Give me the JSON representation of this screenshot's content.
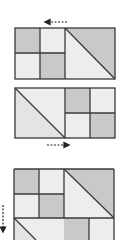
{
  "diagram": {
    "type": "tile-pattern-transformation",
    "colors": {
      "background": "#ffffff",
      "dark_fill": "#c9c9c9",
      "light_fill": "#ededed",
      "stroke": "#3a3a3a",
      "arrow": "#222222"
    },
    "panels": [
      {
        "id": "panel-1",
        "description": "Rectangle: left half is 2x2 checker squares, right half is a square split by diagonal (top-left to bottom-right), upper-right triangle dark",
        "arrow": {
          "direction": "left",
          "position": "above"
        }
      },
      {
        "id": "panel-2",
        "description": "Mirrored rectangle: left half is a square split by diagonal, lower-left triangle light; right half is 2x2 checker squares",
        "arrow": {
          "direction": "right",
          "position": "below"
        }
      },
      {
        "id": "panel-3",
        "description": "Stacked arrangement: top row as panel 1, second row as panel 2 (partially visible)",
        "arrow": {
          "direction": "down",
          "position": "left"
        }
      }
    ]
  }
}
